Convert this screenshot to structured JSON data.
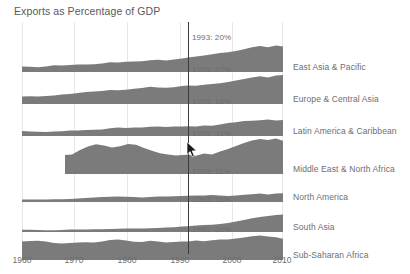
{
  "chart_title": "Exports as Percentage of GDP",
  "colors": {
    "area_fill": "#7b7b7b",
    "text": "#6d6e71",
    "title": "#58595b",
    "gridline": "#e8e8e8",
    "marker_line": "#3b3b3b",
    "background": "#ffffff"
  },
  "cursor": {
    "name": "mouse-pointer",
    "x": 187,
    "y": 142
  },
  "axis": {
    "ticks": [
      {
        "label": "1960",
        "x": 0
      },
      {
        "label": "1970",
        "x": 52
      },
      {
        "label": "1980",
        "x": 105
      },
      {
        "label": "1990",
        "x": 158
      },
      {
        "label": "2000",
        "x": 210
      },
      {
        "label": "2010",
        "x": 261
      }
    ],
    "marker_year": 1993,
    "marker_x": 166
  },
  "chart_data": {
    "type": "area",
    "title": "Exports as Percentage of GDP",
    "xlabel": "",
    "ylabel": "Exports as Percentage of GDP",
    "xlim": [
      1960,
      2012
    ],
    "ylim": [
      0,
      55
    ],
    "grid": true,
    "legend_position": "right-labels",
    "highlight_year": 1993,
    "x": [
      1960,
      1963,
      1966,
      1969,
      1972,
      1975,
      1978,
      1981,
      1984,
      1987,
      1990,
      1993,
      1996,
      1999,
      2002,
      2005,
      2008,
      2011
    ],
    "series": [
      {
        "name": "East Asia & Pacific",
        "annotation": "1993: 20%",
        "value_1993": 20,
        "values": [
          9,
          9,
          9,
          9,
          10,
          11,
          12,
          14,
          14,
          15,
          17,
          20,
          22,
          22,
          26,
          33,
          36,
          32
        ]
      },
      {
        "name": "Europe & Central Asia",
        "annotation": "1993: 27%",
        "value_1993": 27,
        "values": [
          17,
          17,
          17,
          18,
          19,
          21,
          22,
          24,
          25,
          24,
          26,
          27,
          28,
          30,
          32,
          36,
          40,
          42
        ]
      },
      {
        "name": "Latin America & Caribbean",
        "annotation": "1993: 16%",
        "value_1993": 16,
        "values": [
          11,
          10,
          10,
          10,
          11,
          12,
          12,
          13,
          16,
          16,
          16,
          16,
          17,
          19,
          23,
          25,
          25,
          24
        ]
      },
      {
        "name": "Middle East & North Africa",
        "annotation": "1993: 31%",
        "value_1993": 31,
        "data_starts": 1968,
        "values": [
          null,
          null,
          null,
          34,
          40,
          43,
          41,
          43,
          35,
          30,
          31,
          31,
          31,
          31,
          33,
          44,
          49,
          46
        ]
      },
      {
        "name": "North America",
        "annotation": "1993: 11%",
        "value_1993": 11,
        "values": [
          5,
          5,
          5,
          6,
          6,
          8,
          8,
          9,
          8,
          8,
          10,
          11,
          11,
          11,
          10,
          11,
          13,
          14
        ]
      },
      {
        "name": "South Asia",
        "annotation": "1993: 11%",
        "value_1993": 11,
        "values": [
          5,
          5,
          4,
          4,
          5,
          6,
          6,
          6,
          6,
          6,
          8,
          11,
          11,
          12,
          14,
          19,
          23,
          25
        ]
      },
      {
        "name": "Sub-Saharan Africa",
        "annotation": "1993: 26%",
        "value_1993": 26,
        "values": [
          25,
          26,
          26,
          24,
          24,
          25,
          25,
          29,
          26,
          25,
          26,
          26,
          27,
          27,
          30,
          33,
          36,
          33
        ]
      }
    ]
  },
  "panels": [
    {
      "label": "East Asia & Pacific",
      "annotation": "1993: 20%",
      "top": 18,
      "height": 32,
      "label_top": 44,
      "annotation_top": 18,
      "path": "M0,32 L0,26.5 L8,26.8 L16,27.2 L24,26.6 L32,25.2 L40,25.4 L48,25.0 L56,24.4 L64,24.6 L72,24.2 L80,23.4 L88,22.2 L96,22.6 L104,21.8 L112,21.6 L120,21.2 L128,20.2 L136,19.8 L144,20.4 L152,19.6 L160,18.4 L166,17.6 L174,16.4 L182,15.6 L190,14.2 L198,13.0 L206,12.2 L214,11.0 L222,9.2 L230,7.2 L238,6.0 L246,7.2 L254,5.6 L261,6.4 L261,32 Z"
    },
    {
      "label": "Europe & Central Asia",
      "annotation": "1993: 27%",
      "top": 50,
      "height": 32,
      "label_top": 76,
      "annotation_top": 50,
      "path": "M0,32 L0,24.4 L8,24.2 L16,24.6 L24,24.0 L32,23.6 L40,22.6 L48,22.0 L56,21.0 L64,20.0 L72,19.6 L80,19.0 L88,18.0 L96,18.2 L104,17.8 L112,16.8 L120,16.0 L128,14.8 L136,15.6 L144,15.8 L152,15.2 L160,14.0 L166,13.4 L174,13.8 L182,12.8 L190,12.0 L198,11.2 L206,10.0 L214,8.4 L222,7.0 L230,5.6 L238,4.2 L246,5.4 L254,3.6 L261,3.0 L261,32 Z"
    },
    {
      "label": "Latin America & Caribbean",
      "annotation": "1993: 16%",
      "top": 82,
      "height": 32,
      "label_top": 108,
      "annotation_top": 82,
      "path": "M0,32 L0,27.0 L8,27.4 L16,27.8 L24,28.0 L32,27.6 L40,27.2 L48,26.4 L56,26.6 L64,26.0 L72,25.8 L80,25.6 L88,24.2 L96,23.6 L104,24.0 L112,23.4 L120,23.6 L128,22.8 L136,22.4 L144,23.0 L152,22.4 L160,22.6 L166,22.2 L174,22.6 L182,21.4 L190,21.8 L198,20.4 L206,19.0 L214,18.2 L222,17.0 L230,16.8 L238,16.2 L246,15.6 L254,16.4 L261,16.0 L261,32 Z"
    },
    {
      "label": "Middle East & North Africa",
      "annotation": "1993: 31%",
      "top": 114,
      "height": 38,
      "label_top": 142,
      "annotation_top": 114,
      "path": "M43,38 L43,19.0 L50,18.4 L58,14.0 L66,10.4 L74,8.2 L82,9.6 L90,11.4 L98,10.2 L106,8.0 L114,8.8 L122,12.0 L130,14.8 L138,17.2 L146,18.6 L154,19.6 L160,19.0 L166,18.8 L174,19.8 L182,17.6 L190,18.6 L198,15.6 L206,13.0 L214,10.0 L222,7.0 L230,4.4 L238,3.0 L246,4.0 L254,2.6 L261,4.8 L261,38 Z"
    },
    {
      "label": "North America",
      "annotation": "1993: 11%",
      "top": 152,
      "height": 28,
      "label_top": 170,
      "annotation_top": 152,
      "path": "M0,28 L0,25.6 L8,25.6 L16,25.6 L24,25.4 L32,25.2 L40,25.2 L48,25.0 L56,24.6 L64,24.0 L72,23.4 L80,23.0 L88,22.8 L96,22.4 L104,22.8 L112,23.0 L120,23.4 L128,23.0 L136,22.6 L144,22.4 L152,22.2 L160,22.0 L166,21.8 L174,21.6 L182,21.4 L190,21.0 L198,21.4 L206,22.0 L214,21.6 L222,20.8 L230,20.2 L238,19.6 L246,20.4 L254,19.6 L261,19.2 L261,28 Z"
    },
    {
      "label": "South Asia",
      "annotation": "1993: 11%",
      "top": 180,
      "height": 30,
      "label_top": 198,
      "annotation_top": 180,
      "path": "M0,30 L0,27.8 L8,27.8 L16,28.0 L24,28.2 L32,28.2 L40,28.0 L48,27.6 L56,27.4 L64,27.4 L72,27.2 L80,27.2 L88,27.0 L96,26.8 L104,26.6 L112,26.4 L120,26.4 L128,26.2 L136,26.0 L144,25.6 L152,25.2 L160,24.6 L166,24.2 L174,23.6 L182,23.0 L190,22.8 L198,22.0 L206,21.0 L214,19.6 L222,18.0 L230,16.2 L238,15.0 L246,14.0 L254,13.0 L261,12.4 L261,30 Z"
    },
    {
      "label": "Sub-Saharan Africa",
      "annotation": "1993: 26%",
      "top": 210,
      "height": 28,
      "label_top": 228,
      "annotation_top": 210,
      "path": "M0,28 L0,9.6 L8,9.0 L16,8.8 L24,9.6 L32,11.0 L40,11.4 L48,11.0 L56,10.4 L64,10.2 L72,10.6 L80,9.4 L88,8.0 L96,7.4 L104,8.4 L112,9.8 L120,10.0 L128,8.8 L136,9.6 L144,10.4 L152,10.0 L160,9.6 L166,9.4 L174,8.4 L182,9.2 L190,8.2 L198,7.4 L206,7.6 L214,6.6 L222,5.4 L230,4.2 L238,3.4 L246,4.6 L254,5.2 L261,6.8 L261,28 Z"
    }
  ]
}
